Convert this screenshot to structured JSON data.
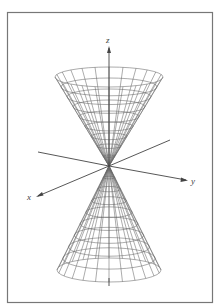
{
  "figure": {
    "frame_color": "#777777",
    "line_color": "#555555",
    "axes": {
      "x": {
        "label": "x"
      },
      "y": {
        "label": "y"
      },
      "z": {
        "label": "z"
      }
    },
    "surface": {
      "type": "double-cone",
      "meridians": 24,
      "parallels": 9
    }
  }
}
